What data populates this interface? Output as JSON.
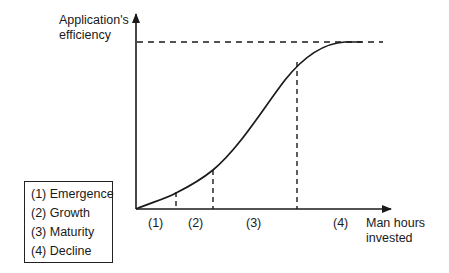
{
  "diagram": {
    "y_axis_label_line1": "Application's",
    "y_axis_label_line2": "efficiency",
    "x_axis_label_line1": "Man hours",
    "x_axis_label_line2": "invested",
    "phase_markers": [
      "(1)",
      "(2)",
      "(3)",
      "(4)"
    ],
    "legend": [
      "(1) Emergence",
      "(2) Growth",
      "(3) Maturity",
      "(4) Decline"
    ],
    "curve": "S-curve (logistic) approaching an upper dashed asymptote",
    "line_color": "#1a1a1a"
  }
}
